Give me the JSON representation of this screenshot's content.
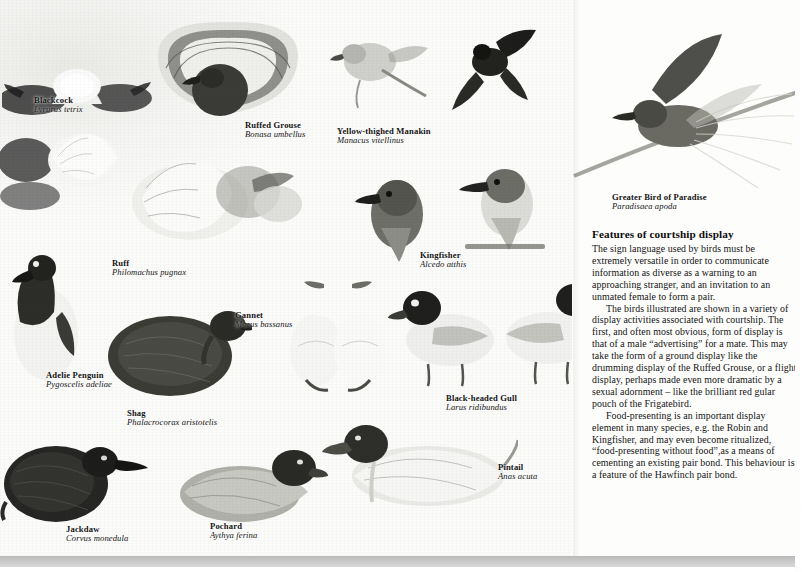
{
  "page": {
    "width": 807,
    "height": 572,
    "kind": "printed-book-plate",
    "ink_color": "#141414",
    "paper_color": "#fdfdfc"
  },
  "article": {
    "heading": "Features of courtship display",
    "paragraphs": [
      "The sign language used by birds must be extremely versatile in order to communicate information as diverse as a warning to an approaching stranger, and an invitation to an unmated female to form a pair.",
      "The birds illustrated are shown in a variety of display activities associated with courtship. The first, and often most obvious, form of display is that of a male “advertising” for a mate. This may take the form of a ground display like the drumming display of the Ruffed Grouse, or a flight display, perhaps made even more dramatic by a sexual adornment – like the brilliant red gular pouch of the Frigatebird.",
      "Food-presenting is an important display element in many species, e.g. the Robin and Kingfisher, and may even become ritualized, “food-presenting without food”,as a means of cementing an existing pair bond. This behaviour is a feature of the Hawfinch pair bond."
    ]
  },
  "plate": {
    "captions": [
      {
        "id": "blackcock",
        "common": "Blackcock",
        "latin": "Lyrurus tetrix",
        "x": 34,
        "y": 96
      },
      {
        "id": "ruffed-grouse",
        "common": "Ruffed Grouse",
        "latin": "Bonasa umbellus",
        "x": 245,
        "y": 121
      },
      {
        "id": "yellow-thighed-manakin",
        "common": "Yellow-thighed Manakin",
        "latin": "Manacus vitellinus",
        "x": 337,
        "y": 127
      },
      {
        "id": "greater-bird-of-paradise",
        "common": "Greater  Bird of Paradise",
        "latin": "Paradisaea apoda",
        "x": 612,
        "y": 193
      },
      {
        "id": "ruff",
        "common": "Ruff",
        "latin": "Philomachus pugnax",
        "x": 112,
        "y": 259
      },
      {
        "id": "kingfisher",
        "common": "Kingfisher",
        "latin": "Alcedo atthis",
        "x": 420,
        "y": 251
      },
      {
        "id": "gannet",
        "common": "Gannet",
        "latin": "Morus bassanus",
        "x": 235,
        "y": 311
      },
      {
        "id": "adelie-penguin",
        "common": "Adelie Penguin",
        "latin": "Pygoscelis adeliae",
        "x": 46,
        "y": 371
      },
      {
        "id": "shag",
        "common": "Shag",
        "latin": "Phalacrocorax aristotelis",
        "x": 127,
        "y": 409
      },
      {
        "id": "black-headed-gull",
        "common": "Black-headed Gull",
        "latin": "Larus ridibundus",
        "x": 446,
        "y": 394
      },
      {
        "id": "pintail",
        "common": "Pintail",
        "latin": "Anas acuta",
        "x": 498,
        "y": 463
      },
      {
        "id": "pochard",
        "common": "Pochard",
        "latin": "Aythya ferina",
        "x": 210,
        "y": 522
      },
      {
        "id": "jackdaw",
        "common": "Jackdaw",
        "latin": "Corvus monedula",
        "x": 66,
        "y": 525
      }
    ]
  }
}
